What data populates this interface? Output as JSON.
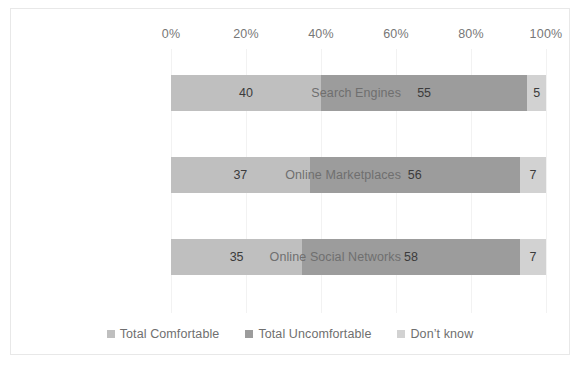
{
  "chart_data": {
    "type": "bar",
    "subtype": "stacked-horizontal-100",
    "title": "",
    "xlabel": "",
    "ylabel": "",
    "categories": [
      "Search Engines",
      "Online Marketplaces",
      "Online Social Networks"
    ],
    "series": [
      {
        "name": "Total Comfortable",
        "color": "#bfbfbf",
        "values": [
          40,
          55,
          35
        ]
      },
      {
        "name": "Total Uncomfortable",
        "color": "#9c9c9c",
        "values": [
          55,
          56,
          58
        ]
      },
      {
        "name": "Don’t know",
        "color": "#d2d2d2",
        "values": [
          5,
          7,
          7
        ]
      }
    ],
    "bars": [
      {
        "category": "Search Engines",
        "segments": [
          40,
          55,
          5
        ]
      },
      {
        "category": "Online Marketplaces",
        "segments": [
          37,
          56,
          7
        ]
      },
      {
        "category": "Online Social Networks",
        "segments": [
          35,
          58,
          7
        ]
      }
    ],
    "xlim": [
      0,
      100
    ],
    "xticks": [
      0,
      20,
      40,
      60,
      80,
      100
    ],
    "xticklabels": [
      "0%",
      "20%",
      "40%",
      "60%",
      "80%",
      "100%"
    ],
    "grid": true,
    "grid_axis": "x",
    "legend_position": "bottom"
  },
  "axis": {
    "ticks": [
      {
        "label": "0%",
        "value": 0
      },
      {
        "label": "20%",
        "value": 20
      },
      {
        "label": "40%",
        "value": 40
      },
      {
        "label": "60%",
        "value": 60
      },
      {
        "label": "80%",
        "value": 80
      },
      {
        "label": "100%",
        "value": 100
      }
    ]
  },
  "categories": [
    {
      "label": "Search Engines"
    },
    {
      "label": "Online Marketplaces"
    },
    {
      "label": "Online Social Networks"
    }
  ],
  "bars": [
    {
      "category": "Search Engines",
      "segments": [
        {
          "series": "Total Comfortable",
          "value": 40,
          "label": "40"
        },
        {
          "series": "Total Uncomfortable",
          "value": 55,
          "label": "55"
        },
        {
          "series": "Don’t know",
          "value": 5,
          "label": "5"
        }
      ]
    },
    {
      "category": "Online Marketplaces",
      "segments": [
        {
          "series": "Total Comfortable",
          "value": 37,
          "label": "37"
        },
        {
          "series": "Total Uncomfortable",
          "value": 56,
          "label": "56"
        },
        {
          "series": "Don’t know",
          "value": 7,
          "label": "7"
        }
      ]
    },
    {
      "category": "Online Social Networks",
      "segments": [
        {
          "series": "Total Comfortable",
          "value": 35,
          "label": "35"
        },
        {
          "series": "Total Uncomfortable",
          "value": 58,
          "label": "58"
        },
        {
          "series": "Don’t know",
          "value": 7,
          "label": "7"
        }
      ]
    }
  ],
  "legend": [
    {
      "label": "Total Comfortable",
      "color": "#bfbfbf"
    },
    {
      "label": "Total Uncomfortable",
      "color": "#9c9c9c"
    },
    {
      "label": "Don’t know",
      "color": "#d2d2d2"
    }
  ],
  "colors": {
    "comfortable": "#bfbfbf",
    "uncomfortable": "#9c9c9c",
    "dont_know": "#d2d2d2",
    "gridline": "#f2f2f2",
    "frame_border": "#e8e8e8",
    "axis_text": "#777777",
    "category_text": "#6f6f6f",
    "data_label_text": "#3b3b3b"
  }
}
